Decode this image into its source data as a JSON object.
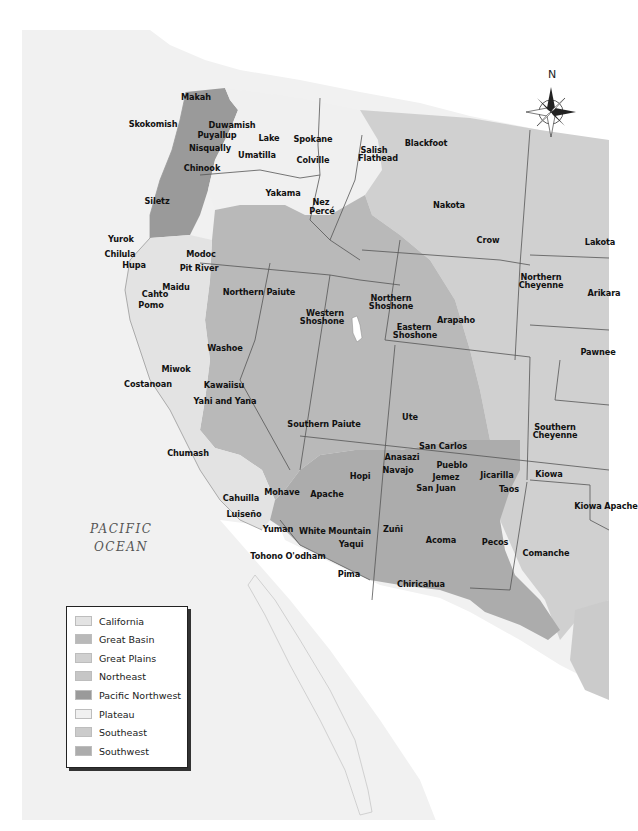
{
  "map": {
    "ocean_label_line1": "PACIFIC",
    "ocean_label_line2": "OCEAN",
    "compass_label": "N",
    "colors": {
      "background": "#ffffff",
      "ocean": "#efefef",
      "california": "#e3e3e3",
      "great_basin": "#b9b9b9",
      "great_plains": "#d0d0d0",
      "northeast": "#c6c6c6",
      "pacific_northwest": "#9a9a9a",
      "plateau": "#f0f0f0",
      "southeast": "#cbcbcb",
      "southwest": "#acacac",
      "border": "#555555"
    },
    "tribes": [
      {
        "name": "Makah",
        "x": 196,
        "y": 97
      },
      {
        "name": "Skokomish",
        "x": 153,
        "y": 124
      },
      {
        "name": "Duwamish",
        "x": 232,
        "y": 125
      },
      {
        "name": "Puyallup",
        "x": 217,
        "y": 135
      },
      {
        "name": "Lake",
        "x": 269,
        "y": 138
      },
      {
        "name": "Spokane",
        "x": 313,
        "y": 139
      },
      {
        "name": "Salish",
        "x": 374,
        "y": 150
      },
      {
        "name": "Flathead",
        "x": 378,
        "y": 158
      },
      {
        "name": "Blackfoot",
        "x": 426,
        "y": 143
      },
      {
        "name": "Nisqually",
        "x": 210,
        "y": 148
      },
      {
        "name": "Umatilla",
        "x": 257,
        "y": 155
      },
      {
        "name": "Colville",
        "x": 313,
        "y": 160
      },
      {
        "name": "Chinook",
        "x": 202,
        "y": 168
      },
      {
        "name": "Yakama",
        "x": 283,
        "y": 193
      },
      {
        "name": "Siletz",
        "x": 157,
        "y": 201
      },
      {
        "name": "Nez",
        "x": 321,
        "y": 202
      },
      {
        "name": "Percé",
        "x": 322,
        "y": 211
      },
      {
        "name": "Nakota",
        "x": 449,
        "y": 205
      },
      {
        "name": "Crow",
        "x": 488,
        "y": 240
      },
      {
        "name": "Lakota",
        "x": 600,
        "y": 242
      },
      {
        "name": "Yurok",
        "x": 121,
        "y": 239
      },
      {
        "name": "Chilula",
        "x": 120,
        "y": 254
      },
      {
        "name": "Modoc",
        "x": 201,
        "y": 254
      },
      {
        "name": "Hupa",
        "x": 134,
        "y": 265
      },
      {
        "name": "Pit River",
        "x": 199,
        "y": 268
      },
      {
        "name": "Northern Paiute",
        "x": 259,
        "y": 292
      },
      {
        "name": "Northern",
        "x": 541,
        "y": 277
      },
      {
        "name": "Cheyenne",
        "x": 541,
        "y": 285
      },
      {
        "name": "Arikara",
        "x": 604,
        "y": 293
      },
      {
        "name": "Maidu",
        "x": 176,
        "y": 287
      },
      {
        "name": "Cahto",
        "x": 155,
        "y": 294
      },
      {
        "name": "Pomo",
        "x": 151,
        "y": 305
      },
      {
        "name": "Western",
        "x": 325,
        "y": 313
      },
      {
        "name": "Shoshone",
        "x": 322,
        "y": 321
      },
      {
        "name": "Northern",
        "x": 391,
        "y": 298
      },
      {
        "name": "Shoshone",
        "x": 391,
        "y": 306
      },
      {
        "name": "Arapaho",
        "x": 456,
        "y": 320
      },
      {
        "name": "Eastern",
        "x": 414,
        "y": 327
      },
      {
        "name": "Shoshone",
        "x": 415,
        "y": 335
      },
      {
        "name": "Pawnee",
        "x": 598,
        "y": 352
      },
      {
        "name": "Washoe",
        "x": 225,
        "y": 348
      },
      {
        "name": "Miwok",
        "x": 176,
        "y": 369
      },
      {
        "name": "Costanoan",
        "x": 148,
        "y": 384
      },
      {
        "name": "Kawaiisu",
        "x": 224,
        "y": 385
      },
      {
        "name": "Yahi and Yana",
        "x": 225,
        "y": 401
      },
      {
        "name": "Southern Paiute",
        "x": 324,
        "y": 424
      },
      {
        "name": "Ute",
        "x": 410,
        "y": 417
      },
      {
        "name": "Southern",
        "x": 555,
        "y": 427
      },
      {
        "name": "Cheyenne",
        "x": 555,
        "y": 435
      },
      {
        "name": "San Carlos",
        "x": 443,
        "y": 446
      },
      {
        "name": "Chumash",
        "x": 188,
        "y": 453
      },
      {
        "name": "Anasazi",
        "x": 402,
        "y": 457
      },
      {
        "name": "Pueblo",
        "x": 452,
        "y": 465
      },
      {
        "name": "Navajo",
        "x": 398,
        "y": 470
      },
      {
        "name": "Jemez",
        "x": 446,
        "y": 477
      },
      {
        "name": "Jicarilla",
        "x": 497,
        "y": 475
      },
      {
        "name": "Kiowa",
        "x": 549,
        "y": 474
      },
      {
        "name": "Hopi",
        "x": 360,
        "y": 476
      },
      {
        "name": "San Juan",
        "x": 436,
        "y": 488
      },
      {
        "name": "Taos",
        "x": 509,
        "y": 489
      },
      {
        "name": "Mohave",
        "x": 282,
        "y": 492
      },
      {
        "name": "Apache",
        "x": 327,
        "y": 494
      },
      {
        "name": "Cahuilla",
        "x": 241,
        "y": 498
      },
      {
        "name": "Kiowa Apache",
        "x": 606,
        "y": 506
      },
      {
        "name": "Luiseño",
        "x": 244,
        "y": 514
      },
      {
        "name": "Yuman",
        "x": 278,
        "y": 529
      },
      {
        "name": "White Mountain",
        "x": 335,
        "y": 531
      },
      {
        "name": "Zuñi",
        "x": 393,
        "y": 529
      },
      {
        "name": "Acoma",
        "x": 441,
        "y": 540
      },
      {
        "name": "Pecos",
        "x": 495,
        "y": 542
      },
      {
        "name": "Yaqui",
        "x": 351,
        "y": 544
      },
      {
        "name": "Comanche",
        "x": 546,
        "y": 553
      },
      {
        "name": "Tohono O'odham",
        "x": 288,
        "y": 556
      },
      {
        "name": "Pima",
        "x": 349,
        "y": 574
      },
      {
        "name": "Chiricahua",
        "x": 421,
        "y": 584
      }
    ]
  },
  "legend": {
    "items": [
      {
        "label": "California",
        "color": "#e3e3e3"
      },
      {
        "label": "Great Basin",
        "color": "#b9b9b9"
      },
      {
        "label": "Great Plains",
        "color": "#d0d0d0"
      },
      {
        "label": "Northeast",
        "color": "#c6c6c6"
      },
      {
        "label": "Pacific Northwest",
        "color": "#9a9a9a"
      },
      {
        "label": "Plateau",
        "color": "#f0f0f0"
      },
      {
        "label": "Southeast",
        "color": "#cbcbcb"
      },
      {
        "label": "Southwest",
        "color": "#acacac"
      }
    ]
  }
}
